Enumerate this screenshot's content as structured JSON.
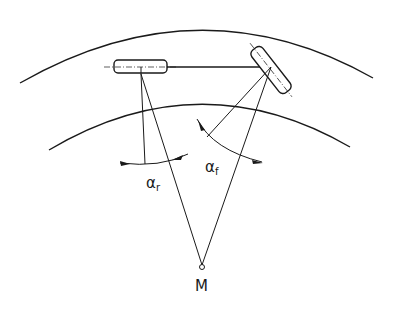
{
  "diagram": {
    "labels": {
      "alpha_r": "α",
      "alpha_r_sub": "r",
      "alpha_f": "α",
      "alpha_f_sub": "f",
      "center": "M"
    },
    "colors": {
      "stroke": "#1a1a1a",
      "background": "#ffffff"
    },
    "elements": [
      {
        "name": "outer-road-edge",
        "type": "arc"
      },
      {
        "name": "inner-road-edge",
        "type": "arc"
      },
      {
        "name": "rear-wheel",
        "type": "rounded-rect"
      },
      {
        "name": "front-wheel",
        "type": "rounded-rect-rotated"
      },
      {
        "name": "wheelbase-line",
        "type": "line"
      },
      {
        "name": "turn-center",
        "type": "point",
        "label": "M"
      },
      {
        "name": "rear-slip-angle",
        "label": "αr"
      },
      {
        "name": "front-slip-angle",
        "label": "αf"
      }
    ]
  }
}
